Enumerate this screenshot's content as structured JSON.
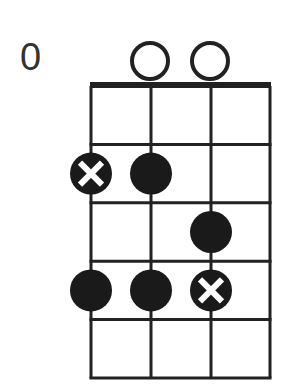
{
  "diagram": {
    "type": "chord-diagram",
    "instrument_strings": 4,
    "fret_label": "0",
    "frets_shown": 5,
    "open_strings": [
      2,
      3
    ],
    "dots": [
      {
        "string": 1,
        "fret": 2,
        "root": true
      },
      {
        "string": 2,
        "fret": 2,
        "root": false
      },
      {
        "string": 3,
        "fret": 3,
        "root": false
      },
      {
        "string": 1,
        "fret": 4,
        "root": false
      },
      {
        "string": 2,
        "fret": 4,
        "root": false
      },
      {
        "string": 3,
        "fret": 4,
        "root": true
      }
    ],
    "colors": {
      "line": "#222222",
      "dot": "#1a1a1a",
      "marker": "#ffffff"
    }
  }
}
